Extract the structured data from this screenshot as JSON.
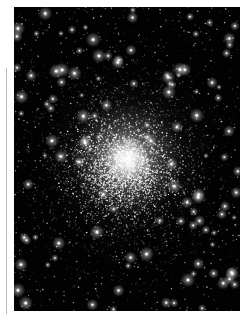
{
  "page": {
    "width": 248,
    "height": 322,
    "background_color": "#ffffff"
  },
  "margin_rule": {
    "name": "vertical-rule",
    "color": "#b9b9b9",
    "x": 6,
    "y": 68,
    "width": 1,
    "height": 246
  },
  "plate": {
    "alt": "Globular star cluster",
    "x": 14,
    "y": 7,
    "width": 226,
    "height": 304,
    "background_color": "#000000",
    "star_color": "#ffffff",
    "cluster": {
      "center_x": 109,
      "center_y": 161,
      "core_radius": 23,
      "halo_radius": 56,
      "outer_radius": 105
    },
    "star_counts": {
      "field": 900,
      "halo": 2600,
      "core": 2200,
      "bright_field": 120
    },
    "seed": 20240517
  }
}
